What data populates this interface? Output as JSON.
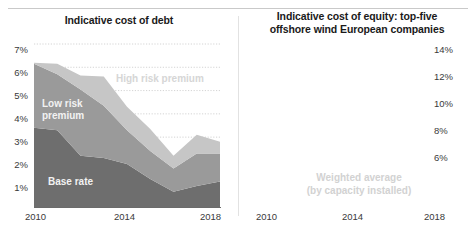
{
  "figure": {
    "panels": [
      {
        "id": "cost-of-debt",
        "title": "Indicative cost of debt"
      },
      {
        "id": "cost-of-equity",
        "title_line1": "Indicative cost of equity: top-five",
        "title_line2": "offshore wind European companies"
      }
    ]
  },
  "labels": {
    "high_risk_premium": "High risk premium",
    "low_risk_premium": "Low risk\npremium",
    "base_rate": "Base rate",
    "weighted_average_line1": "Weighted average",
    "weighted_average_line2": "(by capacity installed)"
  },
  "colors": {
    "base_rate": "#6e6e6e",
    "low_risk_premium": "#9a9a9a",
    "high_risk_premium": "#c6c6c6",
    "range_band": "#d8d8d8",
    "average_line": "#a8a8a8",
    "gridline": "#cfcfcf",
    "axis": "#6b6b6b",
    "text": "#222222"
  },
  "chart_data": [
    {
      "type": "area",
      "id": "cost-of-debt",
      "title": "Indicative cost of debt",
      "xlabel": "",
      "ylabel": "",
      "stacked": true,
      "grid": true,
      "legend": "in-chart labels",
      "x": [
        2010,
        2011,
        2012,
        2013,
        2014,
        2015,
        2016,
        2017,
        2018
      ],
      "xlim": [
        2010,
        2018
      ],
      "xticks": [
        2010,
        2014,
        2018
      ],
      "xticklabels": [
        "2010",
        "2014",
        "2018"
      ],
      "ylim": [
        0,
        7
      ],
      "yticks": [
        1,
        2,
        3,
        4,
        5,
        6,
        7
      ],
      "yticklabels": [
        "1%",
        "2%",
        "3%",
        "4%",
        "5%",
        "6%",
        "7%"
      ],
      "series": [
        {
          "name": "Base rate",
          "values": [
            3.4,
            3.3,
            2.2,
            2.1,
            1.85,
            1.2,
            0.65,
            0.9,
            1.1
          ]
        },
        {
          "name": "Low risk premium",
          "values": [
            2.75,
            2.4,
            2.85,
            2.25,
            1.45,
            1.2,
            1.0,
            1.4,
            1.2
          ]
        },
        {
          "name": "High risk premium",
          "values": [
            0.05,
            0.45,
            0.6,
            1.25,
            1.0,
            0.95,
            0.55,
            0.8,
            0.5
          ]
        }
      ],
      "totals": [
        6.2,
        6.15,
        5.65,
        5.6,
        4.3,
        3.35,
        2.2,
        3.1,
        2.8
      ],
      "annotations": [
        {
          "text": "High risk premium",
          "x": 2013.2,
          "y": 5.2
        },
        {
          "text": "Low risk premium",
          "x": 2010.6,
          "y": 4.1
        },
        {
          "text": "Base rate",
          "x": 2011.6,
          "y": 1.0
        }
      ]
    },
    {
      "type": "area",
      "id": "cost-of-equity",
      "title": "Indicative cost of equity: top-five offshore wind European companies",
      "xlabel": "",
      "ylabel": "",
      "stacked": false,
      "grid": true,
      "legend": "in-chart label",
      "x": [
        2010,
        2011,
        2012,
        2013,
        2014,
        2015,
        2016,
        2017,
        2018
      ],
      "xlim": [
        2010,
        2018
      ],
      "xticks": [
        2010,
        2014,
        2018
      ],
      "xticklabels": [
        "2010",
        "2014",
        "2018"
      ],
      "ylim": [
        2,
        14
      ],
      "yticks": [
        2,
        4,
        6,
        8,
        10,
        12,
        14
      ],
      "yticklabels": [
        "2%",
        "4%",
        "6%",
        "8%",
        "10%",
        "12%",
        "14%"
      ],
      "band": {
        "name": "Range across top-five companies",
        "upper": [
          10.3,
          11.9,
          14.1,
          12.5,
          11.0,
          10.2,
          8.9,
          7.7,
          6.1
        ],
        "lower": [
          5.1,
          5.6,
          5.5,
          6.0,
          5.1,
          6.0,
          4.2,
          3.9,
          2.3
        ]
      },
      "series": [
        {
          "name": "Weighted average (by capacity installed)",
          "values": [
            7.8,
            7.9,
            7.6,
            7.9,
            7.0,
            7.9,
            5.1,
            5.0,
            4.2
          ]
        }
      ],
      "annotations": [
        {
          "text": "Weighted average",
          "x": 2015.2,
          "y": 3.3
        },
        {
          "text": "(by capacity installed)",
          "x": 2015.2,
          "y": 2.5
        },
        {
          "type": "leader-line",
          "x": 2016.9,
          "y_from": 3.7,
          "y_to": 5.0
        }
      ]
    }
  ]
}
